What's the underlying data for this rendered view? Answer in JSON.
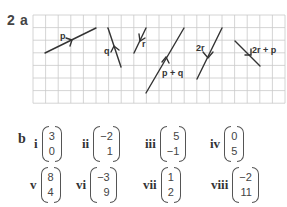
{
  "question": {
    "number": "2",
    "part_a": "a",
    "part_b": "b"
  },
  "grid": {
    "cols": 20,
    "rows": 7,
    "line_color": "#c9c9c9",
    "vector_color": "#333333"
  },
  "vectors": [
    {
      "label": "p",
      "from": [
        3,
        3
      ],
      "to": [
        8,
        1
      ]
    },
    {
      "label": "q",
      "from": [
        10,
        1
      ],
      "to": [
        11,
        4
      ]
    },
    {
      "label": "r",
      "from": [
        13,
        1
      ],
      "to": [
        12,
        3
      ]
    },
    {
      "label": "p + q",
      "from": [
        11,
        6
      ],
      "to": [
        15,
        1
      ]
    },
    {
      "label": "2r",
      "from": [
        15,
        5
      ],
      "to": [
        17,
        1
      ]
    },
    {
      "label": "2r + p",
      "from": [
        19,
        2
      ],
      "to": [
        21,
        4
      ]
    }
  ],
  "answers_b": [
    {
      "numeral": "i",
      "top": "3",
      "bottom": "0"
    },
    {
      "numeral": "ii",
      "top": "−2",
      "bottom": "1"
    },
    {
      "numeral": "iii",
      "top": "5",
      "bottom": "−1"
    },
    {
      "numeral": "iv",
      "top": "0",
      "bottom": "5"
    },
    {
      "numeral": "v",
      "top": "8",
      "bottom": "4"
    },
    {
      "numeral": "vi",
      "top": "−3",
      "bottom": "9"
    },
    {
      "numeral": "vii",
      "top": "1",
      "bottom": "2"
    },
    {
      "numeral": "viii",
      "top": "−2",
      "bottom": "11"
    }
  ]
}
